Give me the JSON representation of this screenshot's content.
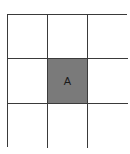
{
  "diagram": {
    "type": "grid",
    "rows": 3,
    "columns": 3,
    "fill_color": "#7a7a7a",
    "line_color": "#3a3a3a",
    "cells": [
      {
        "row": 1,
        "col": 1,
        "label": "",
        "filled": false
      },
      {
        "row": 1,
        "col": 2,
        "label": "",
        "filled": false
      },
      {
        "row": 1,
        "col": 3,
        "label": "",
        "filled": false
      },
      {
        "row": 2,
        "col": 1,
        "label": "",
        "filled": false
      },
      {
        "row": 2,
        "col": 2,
        "label": "A",
        "filled": true
      },
      {
        "row": 2,
        "col": 3,
        "label": "",
        "filled": false
      },
      {
        "row": 3,
        "col": 1,
        "label": "",
        "filled": false
      },
      {
        "row": 3,
        "col": 2,
        "label": "",
        "filled": false
      },
      {
        "row": 3,
        "col": 3,
        "label": "",
        "filled": false
      }
    ]
  }
}
